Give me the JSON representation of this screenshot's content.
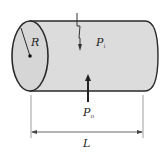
{
  "diagram": {
    "labels": {
      "radius": "R",
      "inner_pressure": {
        "symbol": "P",
        "subscript": "i"
      },
      "outer_pressure": {
        "symbol": "P",
        "subscript": "o"
      },
      "length": "L"
    },
    "colors": {
      "fill": "#dcdcdc",
      "outline": "#2a2a2a",
      "dimension_line": "#444444"
    }
  }
}
